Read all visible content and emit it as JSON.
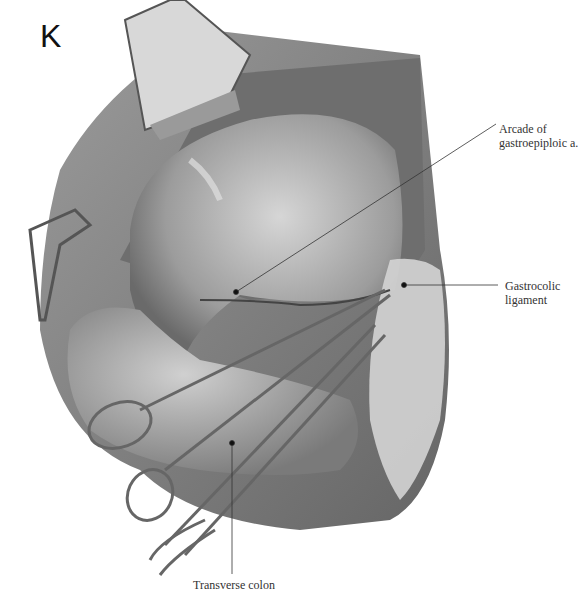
{
  "figure": {
    "panel_letter": "K",
    "colors": {
      "background": "#ffffff",
      "tissue_dark": "#5a5a5a",
      "tissue_mid": "#9a9a9a",
      "tissue_light": "#c8c8c8",
      "instrument": "#6e6e6e",
      "leader_line": "#333333"
    },
    "labels": [
      {
        "id": "arcade",
        "text": "Arcade of\ngastroepiploic a.",
        "anchor": [
          236,
          292
        ],
        "line_end": [
          496,
          124
        ]
      },
      {
        "id": "gastrocolic",
        "text": "Gastrocolic\nligament",
        "anchor": [
          404,
          285
        ],
        "line_end": [
          498,
          285
        ]
      },
      {
        "id": "transverse",
        "text": "Transverse colon",
        "anchor": [
          232,
          443
        ],
        "line_end": [
          232,
          574
        ]
      }
    ],
    "structures": [
      "retractor",
      "abdominal wall",
      "stomach",
      "transverse colon",
      "gastrocolic ligament",
      "scissors",
      "forceps"
    ]
  }
}
